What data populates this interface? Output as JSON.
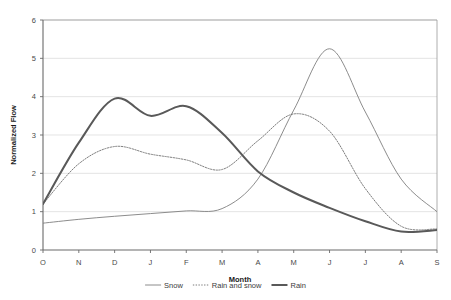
{
  "chart_data": {
    "type": "line",
    "title": "",
    "xlabel": "Month",
    "ylabel": "Normalized Flow",
    "categories": [
      "O",
      "N",
      "D",
      "J",
      "F",
      "M",
      "A",
      "M",
      "J",
      "J",
      "A",
      "S"
    ],
    "xlim": [
      0,
      11
    ],
    "ylim": [
      0,
      6
    ],
    "yticks": [
      0,
      1,
      2,
      3,
      4,
      5,
      6
    ],
    "grid": true,
    "legend_position": "bottom",
    "series": [
      {
        "name": "Snow",
        "style": "thin-solid",
        "color": "#7f7f7f",
        "values": [
          0.7,
          0.8,
          0.88,
          0.95,
          1.02,
          1.08,
          1.85,
          3.65,
          5.25,
          3.6,
          1.85,
          1.0
        ]
      },
      {
        "name": "Rain and snow",
        "style": "dotted",
        "color": "#6e6e6e",
        "values": [
          1.2,
          2.25,
          2.7,
          2.5,
          2.35,
          2.1,
          2.85,
          3.55,
          3.1,
          1.6,
          0.62,
          0.55
        ]
      },
      {
        "name": "Rain",
        "style": "thick-solid",
        "color": "#595959",
        "values": [
          1.2,
          2.8,
          3.95,
          3.5,
          3.75,
          3.05,
          2.05,
          1.5,
          1.1,
          0.75,
          0.48,
          0.52
        ]
      }
    ]
  },
  "yticklabels": [
    "0",
    "1",
    "2",
    "3",
    "4",
    "5",
    "6"
  ],
  "legend": {
    "items": [
      {
        "label": "Snow"
      },
      {
        "label": "Rain and snow"
      },
      {
        "label": "Rain"
      }
    ]
  },
  "axes": {
    "x_title": "Month",
    "y_title": "Normalized Flow"
  }
}
